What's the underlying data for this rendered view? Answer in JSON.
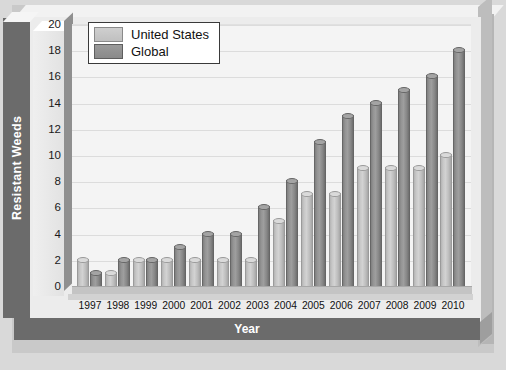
{
  "chart_data": {
    "type": "bar",
    "title": "",
    "xlabel": "Year",
    "ylabel": "Resistant Weeds",
    "categories": [
      "1997",
      "1998",
      "1999",
      "2000",
      "2001",
      "2002",
      "2003",
      "2004",
      "2005",
      "2006",
      "2007",
      "2008",
      "2009",
      "2010"
    ],
    "series": [
      {
        "name": "United States",
        "color": "#c8c8c8",
        "values": [
          2,
          1,
          2,
          2,
          2,
          2,
          2,
          5,
          7,
          7,
          9,
          9,
          9,
          10
        ]
      },
      {
        "name": "Global",
        "color": "#8a8a8a",
        "values": [
          1,
          2,
          2,
          3,
          4,
          4,
          6,
          8,
          11,
          13,
          14,
          15,
          16,
          18
        ]
      }
    ],
    "ylim": [
      0,
      20
    ],
    "yticks": [
      0,
      2,
      4,
      6,
      8,
      10,
      12,
      14,
      16,
      18,
      20
    ],
    "grid": true,
    "legend_position": "top-left"
  },
  "legend": {
    "items": [
      {
        "label": "United States"
      },
      {
        "label": "Global"
      }
    ]
  },
  "axis": {
    "y_title": "Resistant Weeds",
    "x_title": "Year"
  }
}
